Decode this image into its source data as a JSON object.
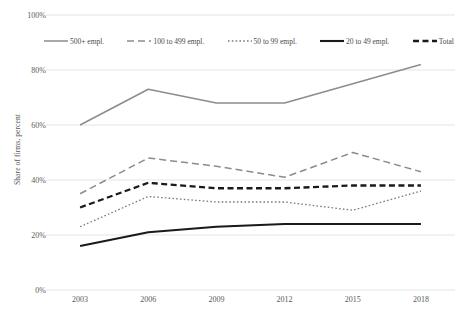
{
  "chart_data": {
    "type": "line",
    "title": "",
    "xlabel": "",
    "ylabel": "Share of firms, percent",
    "categories": [
      "2003",
      "2006",
      "2009",
      "2012",
      "2015",
      "2018"
    ],
    "ylim": [
      0,
      100
    ],
    "ytick_labels": [
      "0%",
      "20%",
      "40%",
      "60%",
      "80%",
      "100%"
    ],
    "ytick_values": [
      0,
      20,
      40,
      60,
      80,
      100
    ],
    "grid": "horizontal",
    "legend_position": "top",
    "series": [
      {
        "name": "500+ empl.",
        "style": "solid-gray",
        "color": "#8c8c8c",
        "values": [
          60,
          73,
          68,
          68,
          75,
          82
        ]
      },
      {
        "name": "100 to 499 empl.",
        "style": "dashed-gray",
        "color": "#8c8c8c",
        "values": [
          35,
          48,
          45,
          41,
          50,
          43
        ]
      },
      {
        "name": "50 to 99 empl.",
        "style": "dotted-gray",
        "color": "#7a7a7a",
        "values": [
          23,
          34,
          32,
          32,
          29,
          36
        ]
      },
      {
        "name": "20 to 49 empl.",
        "style": "solid-black",
        "color": "#1a1a1a",
        "values": [
          16,
          21,
          23,
          24,
          24,
          24
        ]
      },
      {
        "name": "Total",
        "style": "dashed-black",
        "color": "#1a1a1a",
        "values": [
          30,
          39,
          37,
          37,
          38,
          38
        ]
      }
    ]
  },
  "axis": {
    "y_title": "Share of firms, percent"
  }
}
